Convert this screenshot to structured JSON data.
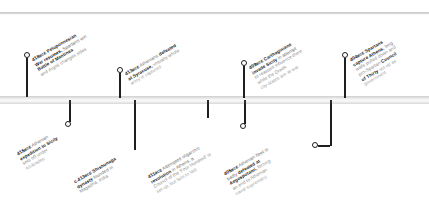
{
  "diagram": {
    "type": "historical-timeline",
    "title": "",
    "era_suffix": "BCE",
    "axis": {
      "orientation": "horizontal",
      "tick_count": 9
    }
  },
  "events": [
    {
      "id": "e418",
      "year": "418",
      "era": "BCE",
      "side": "above",
      "headline_1": "Peloponnesian",
      "headline_2": "War resumes,",
      "headline_3": "Battle of Mantinea",
      "body_1": "Spartans win",
      "body_2": "and Argos changes sides",
      "lines": [
        "418 BCE Peloponnesian",
        "War resumes, Spartans win",
        "Battle of Mantinea",
        "and Argos changes sides"
      ]
    },
    {
      "id": "e415",
      "year": "415",
      "era": "BCE",
      "side": "below",
      "lines": [
        "415 BCE Athenian",
        "expedition to Sicily",
        "sets off under",
        "Alcibiades"
      ]
    },
    {
      "id": "e413c",
      "year": "c.413",
      "era": "BCE",
      "side": "below",
      "lines": [
        "c.413 BCE Shishunaga",
        "dynasty founded in",
        "Magadha, India"
      ]
    },
    {
      "id": "e413",
      "year": "413",
      "era": "BCE",
      "side": "above",
      "lines": [
        "413 BCE Athenians defeated",
        "at Syracuse, virtually whole",
        "army is captured"
      ]
    },
    {
      "id": "e411",
      "year": "411",
      "era": "BCE",
      "side": "below",
      "lines": [
        "411 BCE Attempted oligarchic",
        "revolution in Athens, a",
        "Council of the 'Four Hundred' is",
        "set up, but fails to last"
      ]
    },
    {
      "id": "e409",
      "year": "409",
      "era": "BCE",
      "side": "above",
      "lines": [
        "409 BCE Carthaginians",
        "invade Sicily in attempt",
        "to reassert influence there",
        "while the Greek",
        "city-states are at war"
      ]
    },
    {
      "id": "e405",
      "year": "405",
      "era": "BCE",
      "side": "below",
      "lines": [
        "405 BCE Athenian fleet is",
        "badly defeated at",
        "Aegospotami, forcing",
        "an end to Athenian",
        "naval supremacy"
      ]
    },
    {
      "id": "e404",
      "year": "404",
      "era": "BCE",
      "side": "above",
      "lines": [
        "404 BCE Spartans",
        "capture Athens, long",
        "walls pulled down and",
        "pro-Spartan Council",
        "of Thirty set up as",
        "government"
      ]
    }
  ],
  "colors": {
    "axis": "#cfcfcf",
    "tick": "#2a2a2a",
    "leader": "#1f1f1f",
    "text_strong": "#111111",
    "text_body": "#6f6f6f",
    "background": "#ffffff"
  }
}
